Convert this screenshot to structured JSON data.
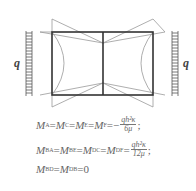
{
  "diagram": {
    "load_label_left": "q",
    "load_label_right": "q",
    "colors": {
      "frame": "#333333",
      "moment": "#999999",
      "load": "#555555"
    }
  },
  "equations": [
    {
      "lhs": [
        "M",
        "A",
        "M",
        "C",
        "M",
        "E",
        "M",
        "F"
      ],
      "sign": "−",
      "num": "qh²κ",
      "den": "6μ",
      "tail": ";"
    },
    {
      "lhs": [
        "M",
        "BA",
        "M",
        "BE",
        "M",
        "DC",
        "M",
        "DF"
      ],
      "sign": "",
      "num": "qh²κ",
      "den": "12μ",
      "tail": ";"
    },
    {
      "lhs": [
        "M",
        "BD",
        "M",
        "DB"
      ],
      "rhs": "0"
    }
  ],
  "eq_text": {
    "e1": {
      "m1": "M",
      "s1": "A",
      "m2": "M",
      "s2": "C",
      "m3": "M",
      "s3": "E",
      "m4": "M",
      "s4": "F",
      "sign": "−",
      "num": "qh²κ",
      "den": "6μ",
      "tail": ";"
    },
    "e2": {
      "m1": "M",
      "s1": "BA",
      "m2": "M",
      "s2": "BE",
      "m3": "M",
      "s3": "DC",
      "m4": "M",
      "s4": "DF",
      "num": "qh²κ",
      "den": "12μ",
      "tail": ";"
    },
    "e3": {
      "m1": "M",
      "s1": "BD",
      "m2": "M",
      "s2": "DB",
      "rhs": "0"
    },
    "eq": "="
  }
}
